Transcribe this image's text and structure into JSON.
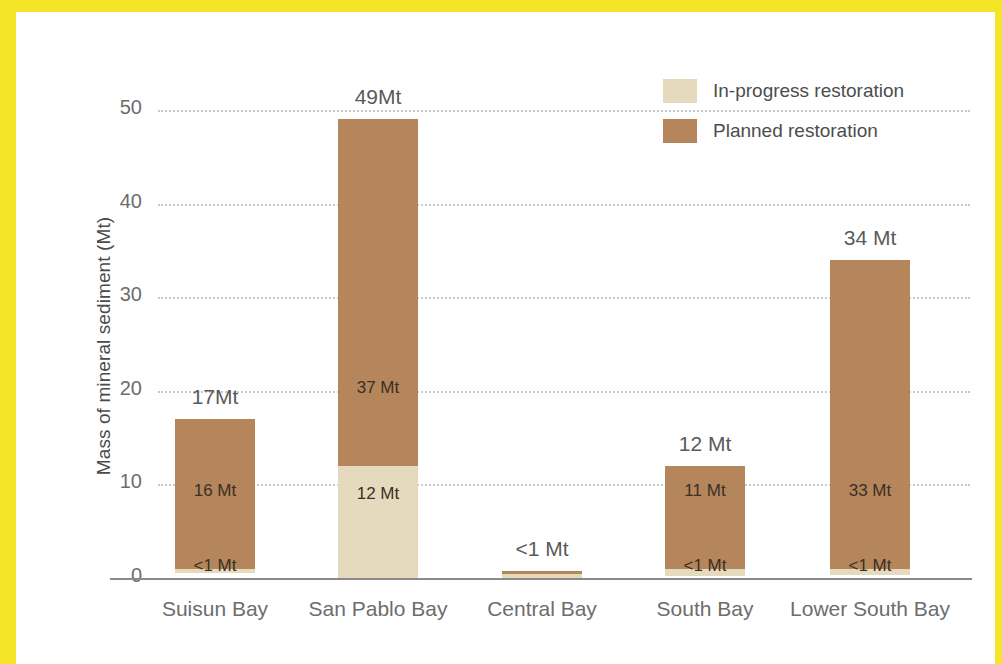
{
  "frame": {
    "accent_color": "#f5e528"
  },
  "legend": {
    "items": [
      {
        "label": "In-progress restoration",
        "color": "#e6dabe",
        "key": "in_progress"
      },
      {
        "label": "Planned restoration",
        "color": "#b5855c",
        "key": "planned"
      }
    ]
  },
  "axes": {
    "y_title": "Mass of mineral sediment (Mt)",
    "y_ticks": [
      "0",
      "10",
      "20",
      "30",
      "40",
      "50"
    ]
  },
  "chart_data": {
    "type": "bar",
    "stacked": true,
    "title": "",
    "xlabel": "",
    "ylabel": "Mass of mineral sediment (Mt)",
    "ylim": [
      0,
      52
    ],
    "yticks": [
      0,
      10,
      20,
      30,
      40,
      50
    ],
    "grid": true,
    "legend_position": "top-right",
    "categories": [
      "Suisun Bay",
      "San Pablo Bay",
      "Central Bay",
      "South Bay",
      "Lower South Bay"
    ],
    "series": [
      {
        "name": "In-progress restoration",
        "color": "#e6dabe",
        "values": [
          0.5,
          12,
          0.4,
          0.8,
          0.7
        ],
        "labels": [
          "<1 Mt",
          "12 Mt",
          "<1 Mt",
          "<1 Mt",
          "<1 Mt"
        ]
      },
      {
        "name": "Planned restoration",
        "color": "#b5855c",
        "values": [
          16,
          37,
          0.3,
          11,
          33
        ],
        "labels": [
          "16 Mt",
          "37 Mt",
          "",
          "11 Mt",
          "33 Mt"
        ]
      }
    ],
    "totals": [
      17,
      49,
      0.7,
      12,
      34
    ],
    "total_labels": [
      "17Mt",
      "49Mt",
      "<1 Mt",
      "12 Mt",
      "34 Mt"
    ]
  }
}
